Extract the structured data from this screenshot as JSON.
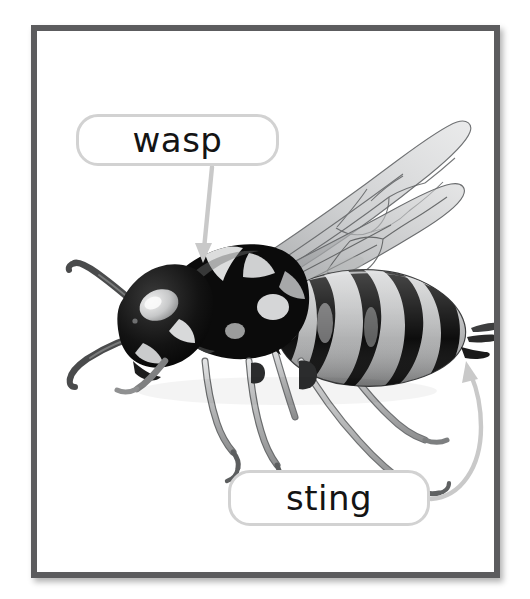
{
  "card": {
    "background_color": "#ffffff",
    "frame_color": "#5c5c5e",
    "frame_inner_color": "#ffffff"
  },
  "photo": {
    "subject": "wasp",
    "description": "black and white photograph of a wasp in side view with wings raised",
    "style": "grayscale-photograph",
    "alt_text": "wasp"
  },
  "callouts": [
    {
      "id": "wasp",
      "label": "wasp",
      "points_to": "thorax",
      "border_color": "#d2d2d2",
      "text_color": "#141414",
      "connector": {
        "type": "straight-arrow",
        "color": "#c9c9c9"
      }
    },
    {
      "id": "sting",
      "label": "sting",
      "points_to": "stinger",
      "border_color": "#d2d2d2",
      "text_color": "#141414",
      "connector": {
        "type": "curved-arrow",
        "color": "#c9c9c9"
      }
    }
  ],
  "icons": {
    "wasp_arrow": "arrow-down-icon",
    "sting_arrow": "arrow-up-left-icon"
  }
}
